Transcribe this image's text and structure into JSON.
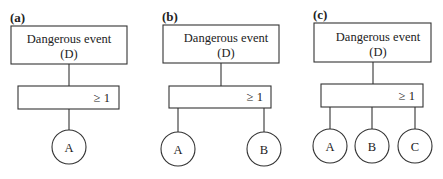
{
  "panels": [
    {
      "label": "(a)",
      "top_event": {
        "line1": "Dangerous event",
        "line2": "(D)"
      },
      "gate": "≥ 1",
      "inputs": [
        "A"
      ]
    },
    {
      "label": "(b)",
      "top_event": {
        "line1": "Dangerous event",
        "line2": "(D)"
      },
      "gate": "≥ 1",
      "inputs": [
        "A",
        "B"
      ]
    },
    {
      "label": "(c)",
      "top_event": {
        "line1": "Dangerous event",
        "line2": "(D)"
      },
      "gate": "≥ 1",
      "inputs": [
        "A",
        "B",
        "C"
      ]
    }
  ],
  "colors": {
    "stroke": "#333333",
    "text": "#222222",
    "background": "#ffffff"
  }
}
